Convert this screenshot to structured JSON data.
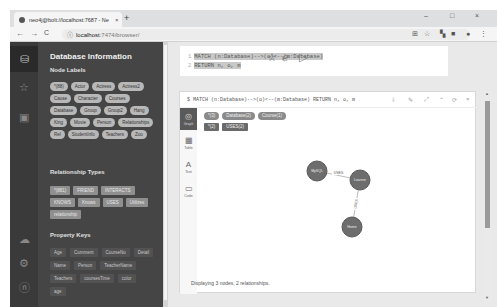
{
  "browser": {
    "tab_title": "neo4j@bolt://localhost:7687 - Neo4j Browser",
    "tab_close": "×",
    "new_tab": "+",
    "window_controls": [
      "–",
      "□",
      "×"
    ],
    "nav": {
      "back": "←",
      "forward": "→",
      "reload": "C"
    },
    "url_host": "localhost",
    "url_path": ":7474/browser/",
    "toolbar_icons": [
      "translate",
      "☆",
      "extension",
      "■",
      "account",
      "⋮"
    ]
  },
  "iconbar": {
    "items": [
      {
        "name": "database",
        "glyph": "⛁",
        "active": true
      },
      {
        "name": "favorites",
        "glyph": "☆",
        "active": false
      },
      {
        "name": "documents",
        "glyph": "▣",
        "active": false
      },
      {
        "name": "cloud-sync",
        "glyph": "☁",
        "active": false
      },
      {
        "name": "settings",
        "glyph": "⚙",
        "active": false
      },
      {
        "name": "about",
        "glyph": "ⓝ",
        "active": false
      }
    ]
  },
  "drawer": {
    "title": "Database Information",
    "node_labels_heading": "Node Labels",
    "node_labels": [
      "*(88)",
      "Actor",
      "Actress",
      "Actress2",
      "Cause",
      "Character",
      "Courses",
      "Database",
      "Group",
      "Group2",
      "Hang",
      "King",
      "Movie",
      "Person",
      "Relationships",
      "Rel",
      "StudentInfo",
      "Teachers",
      "Zoo"
    ],
    "rel_types_heading": "Relationship Types",
    "rel_types": [
      "*(881)",
      "FRIEND",
      "INTERACTS",
      "KNOWS",
      "Knows",
      "USES",
      "Utilizes",
      "relationship"
    ],
    "prop_keys_heading": "Property Keys",
    "prop_keys": [
      "Age",
      "Comment",
      "CourseNo",
      "Detail",
      "Name",
      "Person",
      "TeacherName",
      "Teachers",
      "coursesTime",
      "color",
      "age"
    ]
  },
  "editor": {
    "lines": [
      {
        "num": "1",
        "code": "MATCH (n:Database)-->(o)<--(m:Database)"
      },
      {
        "num": "2",
        "code": "RETURN n, o, m"
      }
    ],
    "favorite_icon": "☆",
    "clear_icon": "⌫",
    "run_icon": "▷"
  },
  "result": {
    "command": "$ MATCH (n:Database)-->(o)<--(m:Database) RETURN n, o, m",
    "actions": [
      "⤓",
      "✎",
      "⤢",
      "⌃",
      "⟳",
      "×"
    ],
    "view_tabs": [
      {
        "glyph": "◎",
        "label": "Graph",
        "active": true
      },
      {
        "glyph": "▦",
        "label": "Table",
        "active": false
      },
      {
        "glyph": "A",
        "label": "Text",
        "active": false
      },
      {
        "glyph": "▭",
        "label": "Code",
        "active": false
      }
    ],
    "legend_nodes": [
      "*(3)",
      "Database(2)",
      "Course(1)"
    ],
    "legend_rels": [
      "*(2)",
      "USES(2)"
    ],
    "graph": {
      "nodes": [
        {
          "label": "MySQL",
          "x": 120,
          "y": 39
        },
        {
          "label": "Learner",
          "x": 163,
          "y": 48
        },
        {
          "label": "Home",
          "x": 155,
          "y": 95
        }
      ],
      "edges": [
        {
          "label": "USES",
          "from": 0,
          "to": 1
        },
        {
          "label": "USES",
          "from": 2,
          "to": 1
        }
      ],
      "node_color": "#6d6d6d",
      "node_stroke": "#5a5a5a"
    },
    "status": "Displaying 3 nodes, 2 relationships."
  }
}
